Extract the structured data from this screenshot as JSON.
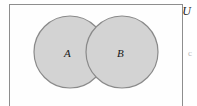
{
  "figure": {
    "kind": "venn-diagram",
    "width": 197,
    "height": 106,
    "background_color": "#ffffff"
  },
  "universe": {
    "label": "U",
    "border_color": "#8e8e8e",
    "fill_color": "#fefefe"
  },
  "sets": [
    {
      "id": "A",
      "label": "A",
      "center_x": 70,
      "center_y": 52,
      "radius": 36,
      "fill_color": "#d3d3d3",
      "stroke_color": "#8a8a8a"
    },
    {
      "id": "B",
      "label": "B",
      "center_x": 122,
      "center_y": 52,
      "radius": 36,
      "fill_color": "#d3d3d3",
      "stroke_color": "#8a8a8a"
    }
  ],
  "intersection": {
    "shaded": true,
    "fill_color": "#d3d3d3"
  },
  "margin_glyph": {
    "text": "c"
  }
}
